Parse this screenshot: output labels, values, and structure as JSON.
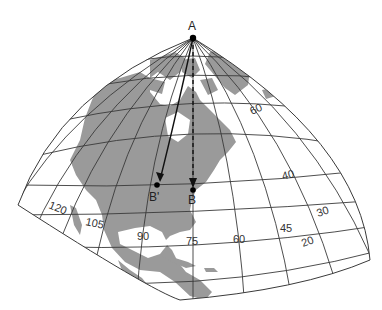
{
  "figure": {
    "title": "",
    "colors": {
      "land": "#9a9a9a",
      "grid": "#3a3a3a",
      "background": "#ffffff",
      "point": "#000000"
    },
    "points": {
      "A": "A",
      "B": "B",
      "B_prime": "B'"
    },
    "longitude_labels": [
      "120",
      "105",
      "90",
      "75",
      "60",
      "45",
      "30"
    ],
    "latitude_labels": [
      "60",
      "40",
      "20"
    ],
    "paths": [
      {
        "from": "A",
        "to": "B'",
        "style": "solid-curve-arrow"
      },
      {
        "from": "A",
        "to": "B",
        "style": "dashed-straight-arrow"
      }
    ]
  }
}
